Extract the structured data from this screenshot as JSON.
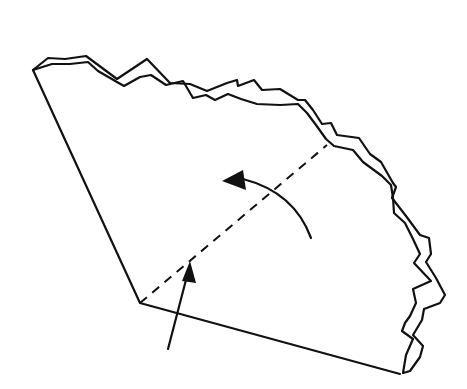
{
  "diagram": {
    "type": "origami-folding-step",
    "colors": {
      "line": "#111111",
      "background": "#ffffff"
    },
    "elements": {
      "paper_outline": "straight-edges",
      "torn_edge": "double-wavy-edge",
      "fold_line": "dashed-valley-fold",
      "fold_arrow": "curved-arrow-counterclockwise",
      "push_arrow": "straight-arrow-up"
    }
  }
}
